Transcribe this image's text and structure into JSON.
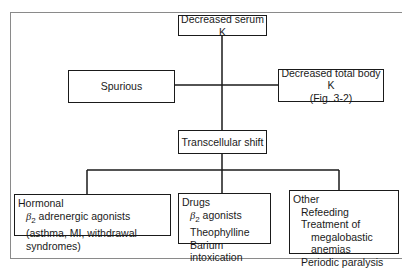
{
  "diagram": {
    "root": {
      "label": "Decreased serum K"
    },
    "left_branch": {
      "label": "Spurious"
    },
    "right_branch": {
      "lines": [
        "Decreased total body K",
        "(Fig. 3-2)"
      ]
    },
    "middle": {
      "label": "Transcellular shift"
    },
    "categories": [
      {
        "title": "Hormonal",
        "items": [
          {
            "prefix": "β",
            "sub": "2",
            "text": " adrenergic agonists"
          },
          {
            "text": "(asthma, MI, withdrawal syndromes)"
          }
        ]
      },
      {
        "title": "Drugs",
        "items": [
          {
            "prefix": "β",
            "sub": "2",
            "text": " agonists"
          },
          {
            "text": "Theophylline"
          },
          {
            "text": "Barium intoxication"
          }
        ]
      },
      {
        "title": "Other",
        "items": [
          {
            "text": "Refeeding"
          },
          {
            "text": "Treatment of"
          },
          {
            "text": "megalobastic anemias",
            "indent": 2
          },
          {
            "text": "Periodic paralysis"
          }
        ]
      }
    ]
  }
}
